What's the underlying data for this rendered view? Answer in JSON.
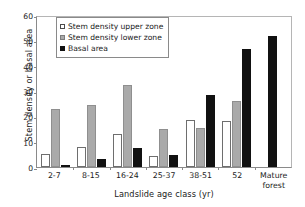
{
  "chart_data": {
    "type": "bar",
    "title": "",
    "xlabel": "Landslide age class (yr)",
    "ylabel": "Stem density or basal area",
    "categories": [
      "2-7",
      "8-15",
      "16-24",
      "25-37",
      "38-51",
      "52",
      "Mature forest"
    ],
    "category_lines": [
      [
        "2-7"
      ],
      [
        "8-15"
      ],
      [
        "16-24"
      ],
      [
        "25-37"
      ],
      [
        "38-51"
      ],
      [
        "52"
      ],
      [
        "Mature",
        "forest"
      ]
    ],
    "series": [
      {
        "name": "Stem density upper zone",
        "color": "#ffffff",
        "values": [
          5.0,
          8.0,
          13.2,
          4.5,
          18.5,
          18.1,
          0
        ]
      },
      {
        "name": "Stem density lower zone",
        "color": "#aaaaaa",
        "values": [
          23.0,
          24.5,
          32.3,
          15.2,
          15.3,
          26.2,
          0
        ]
      },
      {
        "name": "Basal area",
        "color": "#111111",
        "values": [
          0.7,
          3.3,
          7.5,
          4.9,
          28.5,
          46.4,
          51.8
        ]
      }
    ],
    "ylim": [
      0,
      60
    ],
    "yticks": [
      0,
      10,
      20,
      30,
      40,
      50,
      60
    ],
    "grid": false,
    "legend_position": "upper-left-inside"
  },
  "legend": {
    "items": [
      {
        "label": "Stem density upper zone",
        "style": "upper"
      },
      {
        "label": "Stem density lower zone",
        "style": "lower"
      },
      {
        "label": "Basal area",
        "style": "basal"
      }
    ]
  }
}
